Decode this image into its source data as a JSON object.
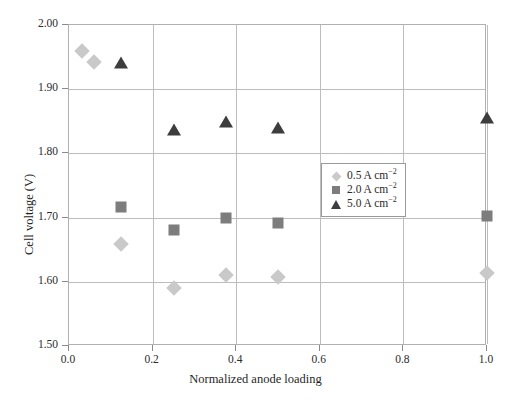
{
  "chart_data": {
    "type": "scatter",
    "title": "",
    "xlabel": "Normalized anode loading",
    "ylabel": "Cell voltage (V)",
    "xlim": [
      0.0,
      1.0
    ],
    "ylim": [
      1.5,
      2.0
    ],
    "xticks": [
      "0.0",
      "0.2",
      "0.4",
      "0.6",
      "0.8",
      "1.0"
    ],
    "xtick_values": [
      0.0,
      0.2,
      0.4,
      0.6,
      0.8,
      1.0
    ],
    "yticks": [
      "1.50",
      "1.60",
      "1.70",
      "1.80",
      "1.90",
      "2.00"
    ],
    "ytick_values": [
      1.5,
      1.6,
      1.7,
      1.8,
      1.9,
      2.0
    ],
    "grid": true,
    "legend_position": "center-right",
    "series": [
      {
        "name": "0.5 A cm",
        "exponent": "−2",
        "marker": "diamond",
        "color": "#c9c9c9",
        "points": [
          {
            "x": 0.03,
            "y": 1.96
          },
          {
            "x": 0.06,
            "y": 1.943
          },
          {
            "x": 0.125,
            "y": 1.659
          },
          {
            "x": 0.25,
            "y": 1.591
          },
          {
            "x": 0.375,
            "y": 1.611
          },
          {
            "x": 0.5,
            "y": 1.608
          },
          {
            "x": 1.0,
            "y": 1.613
          }
        ]
      },
      {
        "name": "2.0 A cm",
        "exponent": "−2",
        "marker": "square",
        "color": "#7d7d7d",
        "points": [
          {
            "x": 0.125,
            "y": 1.716
          },
          {
            "x": 0.25,
            "y": 1.68
          },
          {
            "x": 0.375,
            "y": 1.699
          },
          {
            "x": 0.5,
            "y": 1.691
          },
          {
            "x": 1.0,
            "y": 1.702
          }
        ]
      },
      {
        "name": "5.0 A cm",
        "exponent": "−2",
        "marker": "triangle",
        "color": "#3d3d3d",
        "points": [
          {
            "x": 0.125,
            "y": 1.941
          },
          {
            "x": 0.25,
            "y": 1.836
          },
          {
            "x": 0.375,
            "y": 1.849
          },
          {
            "x": 0.5,
            "y": 1.84
          },
          {
            "x": 1.0,
            "y": 1.855
          }
        ]
      }
    ]
  },
  "legend": {
    "items": [
      {
        "label": "0.5 A cm",
        "exponent": "−2",
        "marker": "diamond"
      },
      {
        "label": "2.0 A cm",
        "exponent": "−2",
        "marker": "square"
      },
      {
        "label": "5.0 A cm",
        "exponent": "−2",
        "marker": "triangle"
      }
    ]
  }
}
